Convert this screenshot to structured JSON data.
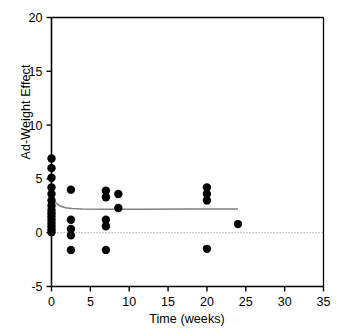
{
  "chart_data": {
    "type": "scatter",
    "title": "",
    "xlabel": "Time (weeks)",
    "ylabel": "Ad-Weight Effect",
    "xlim": [
      0,
      35
    ],
    "ylim": [
      -5,
      20
    ],
    "xticks": [
      0,
      5,
      10,
      15,
      20,
      25,
      30,
      35
    ],
    "yticks": [
      -5,
      0,
      5,
      10,
      15,
      20
    ],
    "xticklabels": [
      "0",
      "5",
      "10",
      "15",
      "20",
      "25",
      "30",
      "35"
    ],
    "yticklabels": [
      "-5",
      "0",
      "5",
      "10",
      "15",
      "20"
    ],
    "grid": false,
    "legend": null,
    "marker": {
      "shape": "circle",
      "color": "#000000",
      "size": 5.2
    },
    "points": [
      {
        "x": 0.0,
        "y": 6.9
      },
      {
        "x": 0.0,
        "y": 6.0
      },
      {
        "x": 0.0,
        "y": 5.1
      },
      {
        "x": 0.0,
        "y": 4.2
      },
      {
        "x": 0.0,
        "y": 3.6
      },
      {
        "x": 0.0,
        "y": 3.0
      },
      {
        "x": 0.0,
        "y": 2.5
      },
      {
        "x": 0.0,
        "y": 2.1
      },
      {
        "x": 0.0,
        "y": 1.8
      },
      {
        "x": 0.0,
        "y": 1.5
      },
      {
        "x": 0.0,
        "y": 1.2
      },
      {
        "x": 0.0,
        "y": 0.9
      },
      {
        "x": 0.0,
        "y": 0.6
      },
      {
        "x": 0.0,
        "y": 0.3
      },
      {
        "x": 0.0,
        "y": 0.05
      },
      {
        "x": 2.5,
        "y": 4.0
      },
      {
        "x": 2.5,
        "y": 1.2
      },
      {
        "x": 2.5,
        "y": 0.35
      },
      {
        "x": 2.5,
        "y": -0.25
      },
      {
        "x": 2.5,
        "y": -1.6
      },
      {
        "x": 7.0,
        "y": 3.9
      },
      {
        "x": 7.0,
        "y": 3.3
      },
      {
        "x": 7.0,
        "y": 1.2
      },
      {
        "x": 7.0,
        "y": 0.6
      },
      {
        "x": 7.0,
        "y": -1.6
      },
      {
        "x": 8.6,
        "y": 3.6
      },
      {
        "x": 8.6,
        "y": 2.3
      },
      {
        "x": 20.0,
        "y": 4.2
      },
      {
        "x": 20.0,
        "y": 3.6
      },
      {
        "x": 20.0,
        "y": 3.0
      },
      {
        "x": 20.0,
        "y": -1.5
      },
      {
        "x": 24.0,
        "y": 0.8
      }
    ],
    "fit_curve": {
      "name": "fitted-trend",
      "color": "#808080",
      "style": "solid",
      "x_start": 0,
      "x_end": 24,
      "points": [
        {
          "x": 0.0,
          "y": 3.25
        },
        {
          "x": 0.25,
          "y": 3.05
        },
        {
          "x": 0.5,
          "y": 2.82
        },
        {
          "x": 0.8,
          "y": 2.62
        },
        {
          "x": 1.2,
          "y": 2.45
        },
        {
          "x": 1.8,
          "y": 2.32
        },
        {
          "x": 2.6,
          "y": 2.25
        },
        {
          "x": 4.0,
          "y": 2.21
        },
        {
          "x": 7.0,
          "y": 2.19
        },
        {
          "x": 12.0,
          "y": 2.19
        },
        {
          "x": 18.0,
          "y": 2.2
        },
        {
          "x": 24.0,
          "y": 2.21
        }
      ]
    },
    "reference_line": {
      "name": "zero-line",
      "y": 0,
      "style": "dotted",
      "color": "#909090",
      "x_start": 0,
      "x_end": 35
    }
  }
}
